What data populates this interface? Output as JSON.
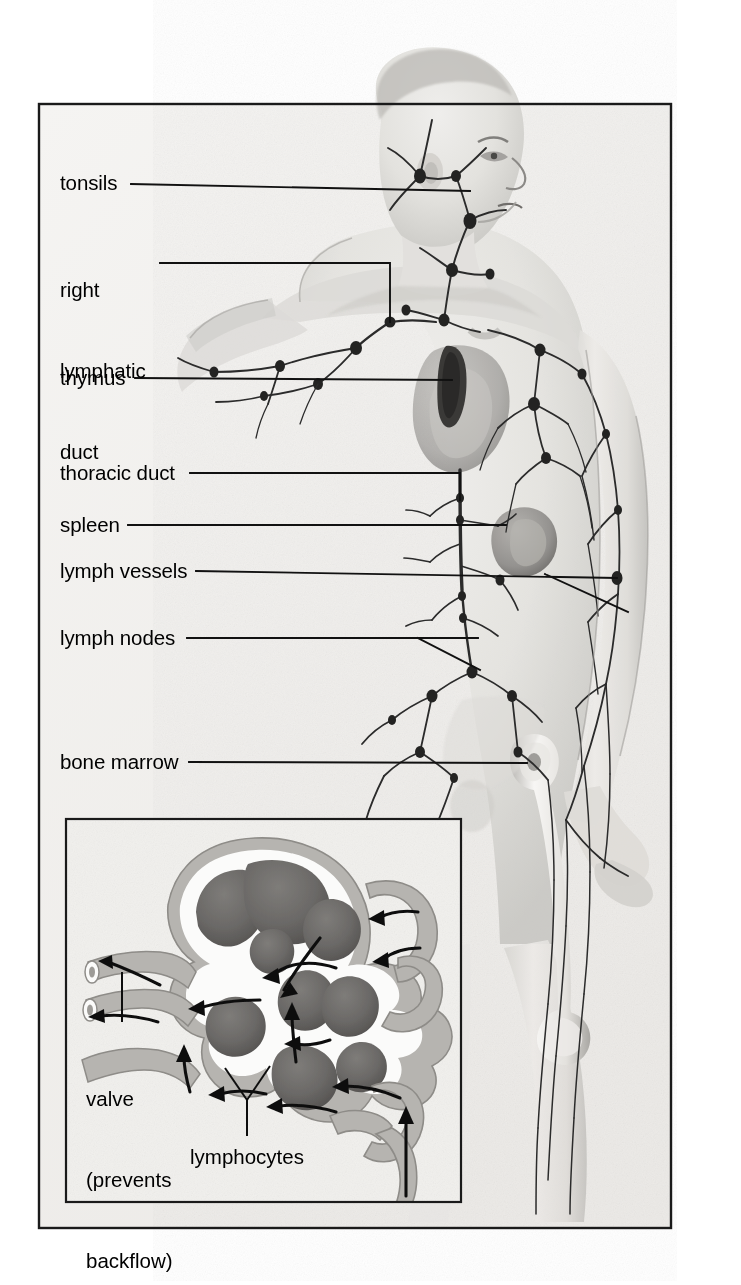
{
  "figure": {
    "frame": {
      "x": 38,
      "y": 103,
      "width": 634,
      "height": 1126,
      "border_color": "#1a1a1a"
    },
    "background_color": "#f2f2f0",
    "body_tone": "#e4e3e0",
    "vessel_color": "#2b2b2b"
  },
  "labels": [
    {
      "id": "tonsils",
      "text": "tonsils",
      "lines": [
        "tonsils"
      ],
      "x": 60,
      "y": 170,
      "leader": {
        "type": "line",
        "points": "131,184 470,191"
      }
    },
    {
      "id": "right-lymphatic-duct",
      "text": "right lymphatic duct",
      "lines": [
        "right",
        "lymphatic",
        "duct"
      ],
      "x": 60,
      "y": 222,
      "leader": {
        "type": "polyline",
        "points": "160,263 390,263 390,322"
      }
    },
    {
      "id": "thymus",
      "text": "thymus",
      "lines": [
        "thymus"
      ],
      "x": 60,
      "y": 365,
      "leader": {
        "type": "line",
        "points": "135,378 452,380"
      }
    },
    {
      "id": "thoracic-duct",
      "text": "thoracic duct",
      "lines": [
        "thoracic duct"
      ],
      "x": 60,
      "y": 460,
      "leader": {
        "type": "polyline",
        "points": "190,473 460,473 460,500"
      }
    },
    {
      "id": "spleen",
      "text": "spleen",
      "lines": [
        "spleen"
      ],
      "x": 60,
      "y": 512,
      "leader": {
        "type": "line",
        "points": "128,525 506,525"
      }
    },
    {
      "id": "lymph-vessels",
      "text": "lymph vessels",
      "lines": [
        "lymph vessels"
      ],
      "x": 60,
      "y": 558,
      "leader": {
        "type": "line",
        "points": "196,571 617,578"
      },
      "leader2": {
        "type": "line",
        "points": "545,574 625,610"
      }
    },
    {
      "id": "lymph-nodes",
      "text": "lymph nodes",
      "lines": [
        "lymph nodes"
      ],
      "x": 60,
      "y": 625,
      "leader": {
        "type": "line",
        "points": "187,638 478,638"
      },
      "leader2": {
        "type": "line",
        "points": "420,638 478,668"
      }
    },
    {
      "id": "bone-marrow",
      "text": "bone marrow",
      "lines": [
        "bone marrow"
      ],
      "x": 60,
      "y": 749,
      "leader": {
        "type": "line",
        "points": "189,762 527,763"
      }
    }
  ],
  "inset": {
    "title": "lymph node cross-section",
    "frame": {
      "x": 65,
      "y": 818,
      "width": 397,
      "height": 385,
      "border_color": "#1a1a1a"
    },
    "background_color": "#f0efec",
    "follicle_color": "#6e6c6a",
    "capsule_color": "#b8b6b2",
    "sinus_color": "#fbfbfa",
    "arrow_color": "#111111",
    "labels": [
      {
        "id": "valve",
        "lines": [
          "valve",
          "(prevents",
          "backflow)"
        ],
        "text": "valve (prevents backflow)",
        "x": 86,
        "y": 1031,
        "leader": {
          "type": "line",
          "points": "122,1024 122,975"
        }
      },
      {
        "id": "lymphocytes",
        "lines": [
          "lymphocytes"
        ],
        "text": "lymphocytes",
        "x": 190,
        "y": 1143,
        "leader": {
          "type": "polyline-fork",
          "stem": "247,1138 247,1100",
          "left": "247,1100 226,1070",
          "right": "247,1100 268,1068"
        }
      }
    ]
  }
}
